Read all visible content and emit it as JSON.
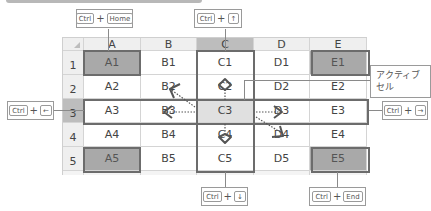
{
  "spreadsheet": {
    "columns": [
      "A",
      "B",
      "C",
      "D",
      "E"
    ],
    "rows": [
      "1",
      "2",
      "3",
      "4",
      "5"
    ],
    "cells": [
      [
        "A1",
        "B1",
        "C1",
        "D1",
        "E1"
      ],
      [
        "A2",
        "B2",
        "C2",
        "D2",
        "E2"
      ],
      [
        "A3",
        "B3",
        "C3",
        "D3",
        "E3"
      ],
      [
        "A4",
        "B4",
        "C4",
        "D4",
        "E4"
      ],
      [
        "A5",
        "B5",
        "C5",
        "D5",
        "E5"
      ]
    ],
    "active_cell": "C3",
    "colors": {
      "corner_cell": "#a9a9a9",
      "active_cell": "#e0e0e0",
      "header_selected": "#bdbdbd",
      "border_highlight": "#6c6c6c"
    }
  },
  "callouts": {
    "home": {
      "modifier": "Ctrl",
      "plus": "+",
      "key": "Home",
      "target": "A1"
    },
    "up": {
      "modifier": "Ctrl",
      "plus": "+",
      "key": "↑",
      "target": "C1"
    },
    "left": {
      "modifier": "Ctrl",
      "plus": "+",
      "key": "←",
      "target": "A3"
    },
    "right": {
      "modifier": "Ctrl",
      "plus": "+",
      "key": "→",
      "target": "E3"
    },
    "down": {
      "modifier": "Ctrl",
      "plus": "+",
      "key": "↓",
      "target": "C5"
    },
    "end": {
      "modifier": "Ctrl",
      "plus": "+",
      "key": "End",
      "target": "E5"
    },
    "active_cell_label": "アクティブセル"
  }
}
